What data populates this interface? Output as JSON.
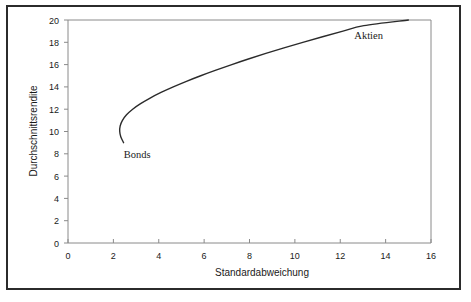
{
  "chart_data": {
    "type": "line",
    "title": "",
    "subtitle": "",
    "xlabel": "Standardabweichung",
    "ylabel": "Durchschnittsrendite",
    "xlim": [
      0,
      16
    ],
    "ylim": [
      0,
      20
    ],
    "xticks": [
      0,
      2,
      4,
      6,
      8,
      10,
      12,
      14,
      16
    ],
    "yticks": [
      0,
      2,
      4,
      6,
      8,
      10,
      12,
      14,
      16,
      18,
      20
    ],
    "xtick_labels": [
      "0",
      "2",
      "4",
      "6",
      "8",
      "10",
      "12",
      "14",
      "16"
    ],
    "ytick_labels": [
      "0",
      "2",
      "4",
      "6",
      "8",
      "10",
      "12",
      "14",
      "16",
      "18",
      "20"
    ],
    "grid": false,
    "legend": "none",
    "series": [
      {
        "name": "Effizienzkurve",
        "color": "#2b2b2b",
        "points": [
          [
            2.45,
            9.0
          ],
          [
            2.33,
            9.5
          ],
          [
            2.28,
            10.0
          ],
          [
            2.3,
            10.5
          ],
          [
            2.4,
            11.0
          ],
          [
            2.58,
            11.5
          ],
          [
            2.85,
            12.0
          ],
          [
            3.2,
            12.5
          ],
          [
            3.62,
            13.0
          ],
          [
            4.1,
            13.5
          ],
          [
            4.64,
            14.0
          ],
          [
            5.22,
            14.5
          ],
          [
            5.85,
            15.0
          ],
          [
            6.52,
            15.5
          ],
          [
            7.22,
            16.0
          ],
          [
            7.95,
            16.5
          ],
          [
            8.72,
            17.0
          ],
          [
            9.52,
            17.5
          ],
          [
            10.35,
            18.0
          ],
          [
            11.22,
            18.5
          ],
          [
            12.12,
            19.0
          ],
          [
            13.04,
            19.5
          ],
          [
            15.0,
            20.0
          ]
        ]
      }
    ],
    "annotations": [
      {
        "text": "Bonds",
        "x": 3.05,
        "y": 7.6
      },
      {
        "text": "Aktien",
        "x": 13.25,
        "y": 18.3
      }
    ]
  },
  "labels": {
    "x_axis_title": "Standardabweichung",
    "y_axis_title": "Durchschnittsrendite",
    "bonds": "Bonds",
    "aktien": "Aktien"
  },
  "ticks": {
    "x": [
      "0",
      "2",
      "4",
      "6",
      "8",
      "10",
      "12",
      "14",
      "16"
    ],
    "y": [
      "0",
      "2",
      "4",
      "6",
      "8",
      "10",
      "12",
      "14",
      "16",
      "18",
      "20"
    ]
  },
  "colors": {
    "curve": "#2b2b2b",
    "axis": "#8a8a8a",
    "text": "#1a1a1a",
    "frame": "#2b2b2b",
    "background": "#ffffff"
  }
}
